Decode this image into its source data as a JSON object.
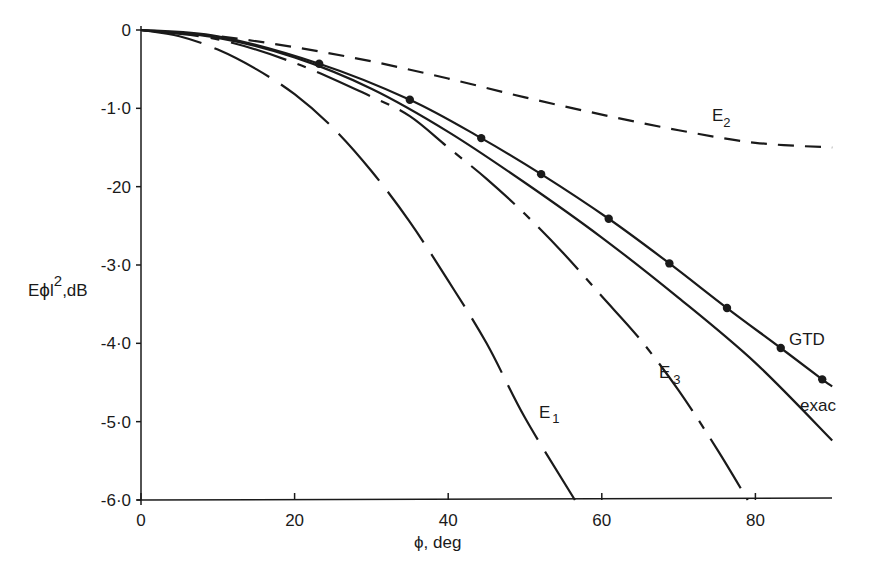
{
  "chart_data": {
    "type": "line",
    "title": "",
    "xlabel": "ϕ, deg",
    "ylabel": "Eϕl²,dB",
    "xlim": [
      0,
      90
    ],
    "ylim": [
      -6.0,
      0
    ],
    "grid": false,
    "x_ticks": [
      0,
      20,
      40,
      60,
      80
    ],
    "x_tick_labels": [
      "0",
      "20",
      "40",
      "60",
      "80"
    ],
    "y_ticks": [
      0,
      -1.0,
      -2.0,
      -3.0,
      -4.0,
      -5.0,
      -6.0
    ],
    "y_tick_labels": [
      "0",
      "-1·0",
      "-20",
      "-3·0",
      "-4·0",
      "-5·0",
      "-6·0"
    ],
    "series": [
      {
        "name": "E1",
        "label": "E",
        "subscript": "1",
        "style": "long-dash",
        "x": [
          0,
          5,
          10,
          15,
          20,
          25,
          30,
          35,
          40,
          45,
          50,
          56.5
        ],
        "y": [
          0,
          -0.08,
          -0.25,
          -0.5,
          -0.82,
          -1.25,
          -1.8,
          -2.45,
          -3.2,
          -4.0,
          -4.95,
          -6.0
        ]
      },
      {
        "name": "E2",
        "label": "E",
        "subscript": "2",
        "style": "short-dash",
        "x": [
          0,
          10,
          20,
          30,
          40,
          50,
          60,
          70,
          80,
          90
        ],
        "y": [
          0,
          -0.08,
          -0.22,
          -0.4,
          -0.62,
          -0.86,
          -1.08,
          -1.28,
          -1.44,
          -1.5
        ]
      },
      {
        "name": "E3",
        "label": "E",
        "subscript": "3",
        "style": "dash-dot",
        "x": [
          0,
          10,
          20,
          30,
          35,
          40,
          45,
          50,
          55,
          60,
          65,
          70,
          75,
          79
        ],
        "y": [
          0,
          -0.12,
          -0.42,
          -0.85,
          -1.1,
          -1.5,
          -1.9,
          -2.35,
          -2.85,
          -3.4,
          -3.95,
          -4.6,
          -5.35,
          -6.0
        ]
      },
      {
        "name": "exact",
        "label": "exac",
        "style": "solid",
        "x": [
          0,
          10,
          20,
          30,
          40,
          50,
          60,
          70,
          80,
          90
        ],
        "y": [
          0,
          -0.1,
          -0.35,
          -0.75,
          -1.3,
          -1.95,
          -2.65,
          -3.42,
          -4.25,
          -5.24
        ]
      },
      {
        "name": "GTD",
        "label": "GTD",
        "style": "solid-with-markers",
        "x": [
          0,
          10,
          23.2,
          35.0,
          44.3,
          52.1,
          60.9,
          68.8,
          76.3,
          83.3,
          88.7,
          90
        ],
        "y": [
          0,
          -0.08,
          -0.43,
          -0.89,
          -1.38,
          -1.84,
          -2.41,
          -2.98,
          -3.55,
          -4.06,
          -4.46,
          -4.55
        ],
        "markers": [
          {
            "x": 23.2,
            "y": -0.43
          },
          {
            "x": 35.0,
            "y": -0.89
          },
          {
            "x": 44.3,
            "y": -1.38
          },
          {
            "x": 52.1,
            "y": -1.84
          },
          {
            "x": 60.9,
            "y": -2.41
          },
          {
            "x": 68.8,
            "y": -2.98
          },
          {
            "x": 76.3,
            "y": -3.55
          },
          {
            "x": 83.3,
            "y": -4.06
          },
          {
            "x": 88.7,
            "y": -4.46
          }
        ]
      }
    ],
    "annotations": [
      {
        "text": "E2",
        "near": "E2 curve at ~75 deg"
      },
      {
        "text": "GTD",
        "near": "GTD curve at ~85 deg"
      },
      {
        "text": "exac",
        "near": "exact curve at ~87 deg (clipped)"
      },
      {
        "text": "E3",
        "near": "E3 curve at ~69 deg"
      },
      {
        "text": "E1",
        "near": "E1 curve at ~52 deg"
      }
    ]
  },
  "colors": {
    "ink": "#1a1a1a",
    "background": "#ffffff"
  }
}
